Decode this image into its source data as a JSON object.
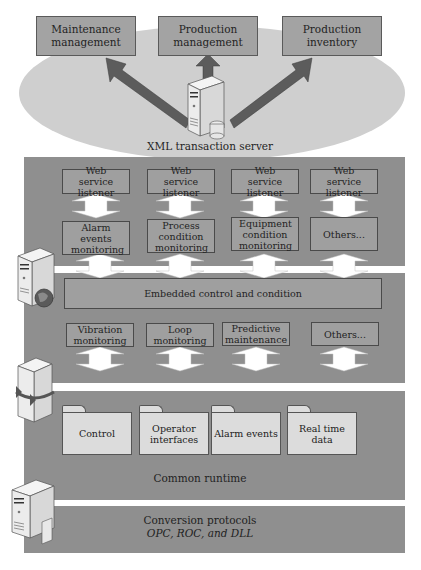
{
  "top_systems": [
    {
      "label": "Maintenance management"
    },
    {
      "label": "Production management"
    },
    {
      "label": "Production inventory"
    }
  ],
  "xml_server": {
    "label": "XML transaction server",
    "icon": "server-database-icon"
  },
  "web_service_listeners": [
    {
      "label": "Web service listener"
    },
    {
      "label": "Web service listener"
    },
    {
      "label": "Web service listener"
    },
    {
      "label": "Web service listener"
    }
  ],
  "monitoring_modules": [
    {
      "label": "Alarm events monitoring"
    },
    {
      "label": "Process condition monitoring"
    },
    {
      "label": "Equipment condition monitoring"
    },
    {
      "label": "Others..."
    }
  ],
  "embedded_layer": {
    "label": "Embedded control and condition",
    "icon": "server-globe-icon"
  },
  "condition_modules": [
    {
      "label": "Vibration monitoring"
    },
    {
      "label": "Loop monitoring"
    },
    {
      "label": "Predictive maintenance"
    },
    {
      "label": "Others..."
    }
  ],
  "runtime_layer": {
    "icon": "server-sync-icon",
    "folders": [
      {
        "label": "Control"
      },
      {
        "label": "Operator interfaces"
      },
      {
        "label": "Alarm events"
      },
      {
        "label": "Real time data"
      }
    ],
    "label": "Common runtime"
  },
  "conversion_layer": {
    "icon": "server-document-icon",
    "title": "Conversion protocols",
    "subtitle": "OPC, ROC, and DLL"
  },
  "colors": {
    "panel": "#8f8f8f",
    "box": "#9f9f9f",
    "ellipse": "#cfcfcf",
    "folder": "#dcdcdc",
    "arrow_dark": "#5a5a5a"
  }
}
